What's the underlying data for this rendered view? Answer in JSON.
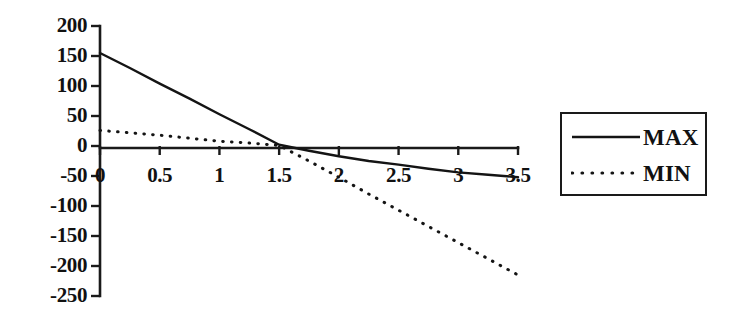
{
  "chart_data": {
    "type": "line",
    "title": "",
    "subtitle": "",
    "xlabel": "",
    "ylabel": "",
    "xlim": [
      0,
      3.5
    ],
    "ylim": [
      -250,
      200
    ],
    "grid": false,
    "legend_position": "right-outside",
    "x_ticks": [
      "0",
      "0.5",
      "1",
      "1.5",
      "2",
      "2.5",
      "3",
      "3.5"
    ],
    "x_tick_values": [
      0,
      0.5,
      1,
      1.5,
      2,
      2.5,
      3,
      3.5
    ],
    "y_ticks": [
      "200",
      "150",
      "100",
      "50",
      "0",
      "-50",
      "-100",
      "-150",
      "-200",
      "-250"
    ],
    "y_tick_values": [
      200,
      150,
      100,
      50,
      0,
      -50,
      -100,
      -150,
      -200,
      -250
    ],
    "x": [
      0,
      0.25,
      0.5,
      0.75,
      1,
      1.25,
      1.5,
      1.75,
      2,
      2.25,
      2.5,
      2.75,
      3,
      3.25,
      3.5
    ],
    "series": [
      {
        "name": "MAX",
        "style": "solid",
        "color": "#141414",
        "values": [
          155,
          130,
          104,
          79,
          53,
          28,
          2,
          -8,
          -17,
          -25,
          -31,
          -38,
          -44,
          -48,
          -52
        ]
      },
      {
        "name": "MIN",
        "style": "dotted",
        "color": "#141414",
        "values": [
          26,
          22,
          18,
          13,
          8,
          5,
          1,
          -25,
          -52,
          -80,
          -107,
          -134,
          -161,
          -188,
          -215
        ]
      }
    ]
  },
  "legend": {
    "items": [
      {
        "label": "MAX",
        "style": "solid"
      },
      {
        "label": "MIN",
        "style": "dotted"
      }
    ]
  }
}
